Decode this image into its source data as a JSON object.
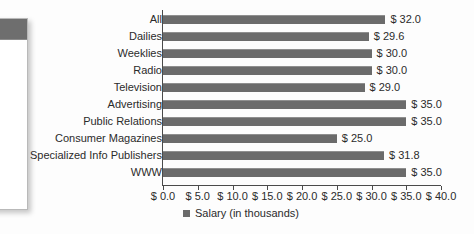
{
  "background_panel": {
    "name": "partially-visible-window",
    "titlebar_color": "#6e6e6e",
    "body_color": "#ffffff"
  },
  "chart_data": {
    "type": "bar",
    "orientation": "horizontal",
    "title": "",
    "xlabel": "",
    "ylabel": "",
    "xlim": [
      0.0,
      40.0
    ],
    "xtick_step": 5.0,
    "grid": false,
    "legend_position": "bottom-center",
    "bar_color": "#6b6b6b",
    "categories": [
      "All",
      "Dailies",
      "Weeklies",
      "Radio",
      "Television",
      "Advertising",
      "Public Relations",
      "Consumer Magazines",
      "Specialized Info Publishers",
      "WWW"
    ],
    "values": [
      32.0,
      29.6,
      30.0,
      30.0,
      29.0,
      35.0,
      35.0,
      25.0,
      31.8,
      35.0
    ],
    "value_labels": [
      "$ 32.0",
      "$ 29.6",
      "$ 30.0",
      "$ 30.0",
      "$ 29.0",
      "$ 35.0",
      "$ 35.0",
      "$ 25.0",
      "$ 31.8",
      "$ 35.0"
    ],
    "xtick_labels": [
      "$ 0.0",
      "$ 5.0",
      "$ 10.0",
      "$ 15.0",
      "$ 20.0",
      "$ 25.0",
      "$ 30.0",
      "$ 35.0",
      "$ 40.0"
    ],
    "xtick_values": [
      0.0,
      5.0,
      10.0,
      15.0,
      20.0,
      25.0,
      30.0,
      35.0,
      40.0
    ],
    "series": [
      {
        "name": "Salary (in thousands)",
        "values": [
          32.0,
          29.6,
          30.0,
          30.0,
          29.0,
          35.0,
          35.0,
          25.0,
          31.8,
          35.0
        ]
      }
    ],
    "legend": [
      "Salary (in thousands)"
    ]
  }
}
